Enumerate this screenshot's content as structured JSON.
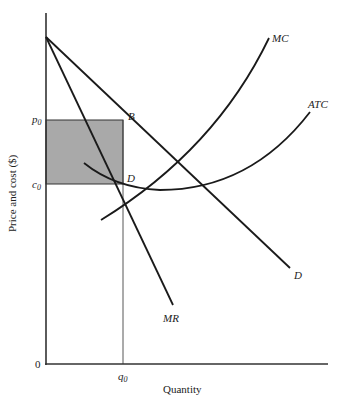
{
  "diagram": {
    "type": "monopoly-profit-diagram",
    "axes": {
      "x_label": "Quantity",
      "y_label": "Price and cost ($)",
      "origin_label": "0"
    },
    "tick_labels": {
      "price": {
        "base": "p",
        "sub": "0"
      },
      "cost": {
        "base": "c",
        "sub": "0"
      },
      "quantity": {
        "base": "q",
        "sub": "0"
      }
    },
    "curves": {
      "demand": "D",
      "marginal_revenue": "MR",
      "marginal_cost": "MC",
      "average_total_cost": "ATC"
    },
    "points": {
      "b": "B",
      "d": "D"
    },
    "colors": {
      "line": "#1a1a1a",
      "profit_area": "#a9a9a9",
      "background": "#ffffff"
    }
  }
}
